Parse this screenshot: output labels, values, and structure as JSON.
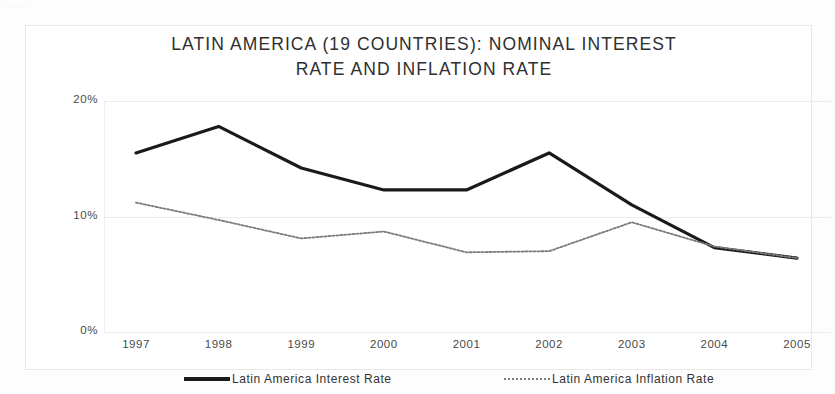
{
  "figure": {
    "scan_artifact_text": "____",
    "background_color": "#fdfdfd",
    "frame_color": "#e8e8e8"
  },
  "chart_data": {
    "type": "line",
    "title": "LATIN AMERICA (19 COUNTRIES): NOMINAL INTEREST RATE AND INFLATION RATE",
    "title_line1": "LATIN AMERICA (19 COUNTRIES): NOMINAL INTEREST",
    "title_line2": "RATE AND INFLATION RATE",
    "xlabel": "",
    "ylabel": "",
    "x": [
      "1997",
      "1998",
      "1999",
      "2000",
      "2001",
      "2002",
      "2003",
      "2004",
      "2005"
    ],
    "categories": [
      "1997",
      "1998",
      "1999",
      "2000",
      "2001",
      "2002",
      "2003",
      "2004",
      "2005"
    ],
    "ylim": [
      0,
      20
    ],
    "yticks": [
      0,
      10,
      20
    ],
    "ytick_labels": [
      "0%",
      "10%",
      "20%"
    ],
    "grid": true,
    "grid_axis": "y",
    "legend_position": "bottom",
    "series": [
      {
        "name": "Latin America Interest Rate",
        "color": "#1a1a1a",
        "style": "solid",
        "width": 3.2,
        "values": [
          15.5,
          17.8,
          14.2,
          12.3,
          12.3,
          15.5,
          11.0,
          7.3,
          6.4
        ]
      },
      {
        "name": "Latin America Inflation Rate",
        "color": "#7b7b7b",
        "style": "dotted",
        "width": 1.8,
        "values": [
          11.2,
          9.7,
          8.1,
          8.7,
          6.9,
          7.0,
          9.5,
          7.4,
          6.4
        ]
      }
    ]
  },
  "legend": {
    "items": [
      {
        "label": "Latin America Interest Rate",
        "swatch": "solid-thick-black"
      },
      {
        "label": "Latin America Inflation Rate",
        "swatch": "dotted-thin-gray"
      }
    ]
  }
}
